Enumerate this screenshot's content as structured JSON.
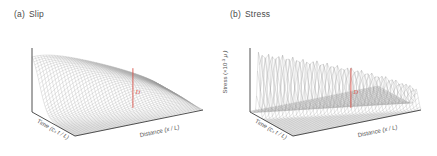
{
  "figure": {
    "background": "#ffffff",
    "mesh_color": "#9a9a9a",
    "axis_color": "#3d3d3d",
    "marker_color": "#d9544a",
    "text_color": "#4a4a4a"
  },
  "panels": [
    {
      "tag": "(a)",
      "title": "Slip",
      "marker_label": "D",
      "zaxis_label": "",
      "xaxis": {
        "name": "Time",
        "units": "(c_s t / L)"
      },
      "yaxis": {
        "name": "Distance",
        "units": "(x / L)"
      }
    },
    {
      "tag": "(b)",
      "title": "Stress",
      "marker_label": "D",
      "zaxis": {
        "name": "Stress",
        "units": "(×10",
        "exp": "-3",
        "unit2": " μ )"
      },
      "xaxis": {
        "name": "Time",
        "units": "(c_s t / L)"
      },
      "yaxis": {
        "name": "Distance",
        "units": "(x / L)"
      }
    }
  ],
  "chart_data": [
    {
      "type": "surface",
      "panel": "a",
      "title": "Slip",
      "xlabel": "Time (c_s t / L)",
      "ylabel": "Distance (x / L)",
      "zlabel": "Slip",
      "description": "3D wireframe surface of slip versus distance and time. Slip is zero over most of the domain and rises to a broad smooth plateau ridge at small distance / late time, falling off steeply along a curved rupture front.",
      "xlim": [
        0,
        1
      ],
      "ylim": [
        0,
        1
      ],
      "zlim": [
        0,
        1
      ],
      "grid": true,
      "legend": false,
      "marker": {
        "label": "D",
        "type": "vertical-line",
        "x": 0.5,
        "y": 0.62
      },
      "ridge_profile": [
        0.0,
        0.08,
        0.3,
        0.62,
        0.86,
        0.97,
        1.0,
        0.98,
        0.9,
        0.72,
        0.42,
        0.16,
        0.04,
        0.0
      ]
    },
    {
      "type": "surface",
      "panel": "b",
      "title": "Stress",
      "xlabel": "Time (c_s t / L)",
      "ylabel": "Distance (x / L)",
      "zlabel": "Stress (×10^-3 μ)",
      "description": "3D wireframe surface of shear stress versus distance and time. The surface is flat and near zero everywhere except for a sharp narrow spike ridge marking the propagating rupture front.",
      "xlim": [
        0,
        1
      ],
      "ylim": [
        0,
        1
      ],
      "zlim": [
        0,
        1
      ],
      "grid": true,
      "legend": false,
      "marker": {
        "label": "D",
        "type": "vertical-line",
        "x": 0.5,
        "y": 0.62
      },
      "ridge_profile": [
        0.0,
        0.05,
        0.2,
        0.55,
        0.85,
        1.0,
        0.9,
        0.6,
        0.3,
        0.12,
        0.04,
        0.0
      ]
    }
  ]
}
